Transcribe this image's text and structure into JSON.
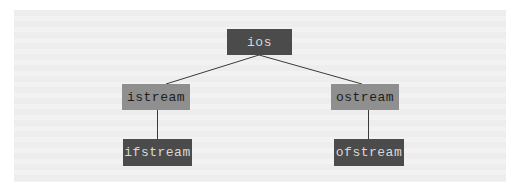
{
  "diagram": {
    "title": "",
    "colors": {
      "background": "#ffffff",
      "panel": "#f2f2f2",
      "dark_node": "#4b4b4b",
      "dark_node_text": "#d8d8d8",
      "mid_node": "#8f8f8f",
      "mid_node_text": "#1e1e1e",
      "connector": "#3a3a3a"
    },
    "nodes": [
      {
        "id": "ios",
        "label": "ios",
        "style": "dark",
        "level": 0
      },
      {
        "id": "istream",
        "label": "istream",
        "style": "mid",
        "level": 1,
        "parent": "ios"
      },
      {
        "id": "ostream",
        "label": "ostream",
        "style": "mid",
        "level": 1,
        "parent": "ios"
      },
      {
        "id": "ifstream",
        "label": "ifstream",
        "style": "dark",
        "level": 2,
        "parent": "istream"
      },
      {
        "id": "ofstream",
        "label": "ofstream",
        "style": "dark",
        "level": 2,
        "parent": "ostream"
      }
    ],
    "edges": [
      {
        "from": "ios",
        "to": "istream"
      },
      {
        "from": "ios",
        "to": "ostream"
      },
      {
        "from": "istream",
        "to": "ifstream"
      },
      {
        "from": "ostream",
        "to": "ofstream"
      }
    ]
  }
}
